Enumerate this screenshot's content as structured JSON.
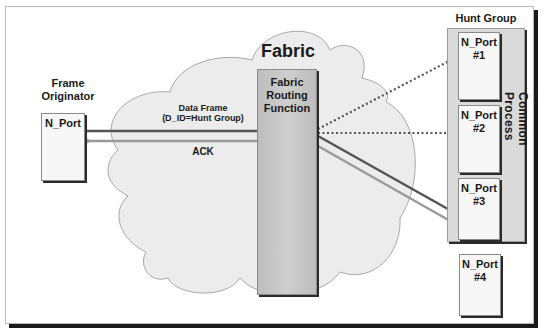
{
  "diagram": {
    "fabric": {
      "title": "Fabric"
    },
    "routing_function": {
      "label_lines": [
        "Fabric",
        "Routing",
        "Function"
      ]
    },
    "originator": {
      "title_lines": [
        "Frame",
        "Originator"
      ],
      "port_label": "N_Port"
    },
    "hunt_group": {
      "title": "Hunt Group",
      "common_process": "Common Process",
      "ports": [
        {
          "line1": "N_Port",
          "line2": "#1",
          "in_group": true
        },
        {
          "line1": "N_Port",
          "line2": "#2",
          "in_group": true
        },
        {
          "line1": "N_Port",
          "line2": "#3",
          "in_group": true
        },
        {
          "line1": "N_Port",
          "line2": "#4",
          "in_group": false
        }
      ]
    },
    "links": {
      "data_frame_lines": [
        "Data Frame",
        "(D_ID=Hunt Group)"
      ],
      "ack": "ACK"
    },
    "colors": {
      "cloud_fill": "#ececec",
      "cloud_stroke": "#a8a8a8",
      "data_arrow": "#555555",
      "ack_arrow": "#9a9a9a",
      "dotted_arrow": "#555555"
    }
  }
}
